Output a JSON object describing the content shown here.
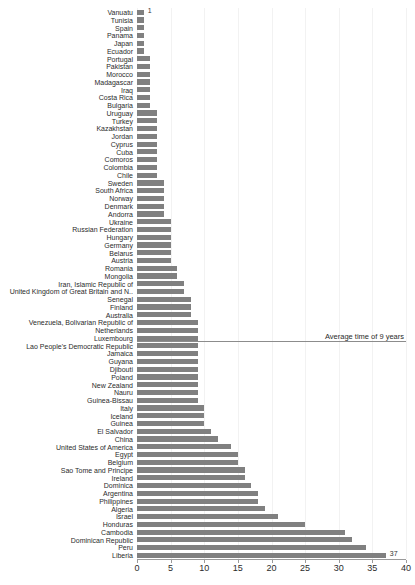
{
  "chart_data": {
    "type": "bar",
    "orientation": "horizontal",
    "title": "",
    "subtitle": "",
    "xlabel": "",
    "ylabel": "",
    "xlim": [
      0,
      40
    ],
    "xticks": [
      0,
      5,
      10,
      15,
      20,
      25,
      30,
      35,
      40
    ],
    "xtick_labels": [
      "0",
      "5",
      "10",
      "15",
      "20",
      "25",
      "30",
      "35",
      "40"
    ],
    "grid": true,
    "grid_axis": "x",
    "legend": false,
    "bar_color": "#808080",
    "annotations": [
      {
        "name": "average-line",
        "text": "Average time of 9 years",
        "value": 9,
        "at_category_index": 43,
        "line_color": "#8c8c8c"
      }
    ],
    "value_labels": [
      {
        "category": "Vanuatu",
        "text": "1"
      },
      {
        "category": "Liberia",
        "text": "37"
      }
    ],
    "categories": [
      "Vanuatu",
      "Tunisia",
      "Spain",
      "Panama",
      "Japan",
      "Ecuador",
      "Portugal",
      "Pakistan",
      "Morocco",
      "Madagascar",
      "Iraq",
      "Costa Rica",
      "Bulgaria",
      "Uruguay",
      "Turkey",
      "Kazakhstan",
      "Jordan",
      "Cyprus",
      "Cuba",
      "Comoros",
      "Colombia",
      "Chile",
      "Sweden",
      "South Africa",
      "Norway",
      "Denmark",
      "Andorra",
      "Ukraine",
      "Russian Federation",
      "Hungary",
      "Germany",
      "Belarus",
      "Austria",
      "Romania",
      "Mongolia",
      "Iran, Islamic Republic of",
      "United Kingdom of Great Britain and N..",
      "Senegal",
      "Finland",
      "Australia",
      "Venezuela, Bolivarian Republic of",
      "Netherlands",
      "Luxembourg",
      "Lao People's Democratic Republic",
      "Jamaica",
      "Guyana",
      "Djibouti",
      "Poland",
      "New Zealand",
      "Nauru",
      "Guinea-Bissau",
      "Italy",
      "Iceland",
      "Guinea",
      "El Salvador",
      "China",
      "United States of America",
      "Egypt",
      "Belgium",
      "Sao Tome and Principe",
      "Ireland",
      "Dominica",
      "Argentina",
      "Philippines",
      "Algeria",
      "Israel",
      "Honduras",
      "Cambodia",
      "Dominican Republic",
      "Peru",
      "Liberia"
    ],
    "values": [
      1,
      1,
      1,
      1,
      1,
      1,
      2,
      2,
      2,
      2,
      2,
      2,
      2,
      3,
      3,
      3,
      3,
      3,
      3,
      3,
      3,
      3,
      4,
      4,
      4,
      4,
      4,
      5,
      5,
      5,
      5,
      5,
      5,
      6,
      6,
      7,
      7,
      8,
      8,
      8,
      9,
      9,
      9,
      9,
      9,
      9,
      9,
      9,
      9,
      9,
      9,
      10,
      10,
      10,
      11,
      12,
      14,
      15,
      15,
      16,
      16,
      17,
      18,
      18,
      19,
      21,
      25,
      31,
      32,
      34,
      37
    ]
  }
}
